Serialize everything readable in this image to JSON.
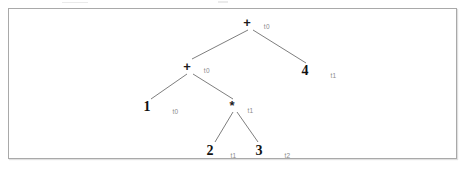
{
  "figure": {
    "kind": "expression-parse-tree",
    "expression": "1 + 2 * 3 + 4",
    "register_labels": [
      "t0",
      "t1",
      "t2"
    ]
  },
  "frame": {
    "border_color": "#a9a9a9",
    "background": "#ffffff"
  },
  "colors": {
    "node_text": "#111111",
    "register_text": "#8a8a8a",
    "edge": "#6f6f6f"
  },
  "nodes": [
    {
      "id": "root-plus",
      "symbol": "+",
      "register": "t0",
      "kind": "operator",
      "x": 250,
      "y": 22,
      "reg_dx": 13,
      "reg_dy": 2
    },
    {
      "id": "inner-plus",
      "symbol": "+",
      "register": "t0",
      "kind": "operator",
      "x": 190,
      "y": 66,
      "reg_dx": 13,
      "reg_dy": 2
    },
    {
      "id": "leaf-four",
      "symbol": "4",
      "register": "t1",
      "kind": "number",
      "x": 308,
      "y": 70,
      "reg_dx": 22,
      "reg_dy": 3
    },
    {
      "id": "leaf-one",
      "symbol": "1",
      "register": "t0",
      "kind": "number",
      "x": 150,
      "y": 106,
      "reg_dx": 22,
      "reg_dy": 3
    },
    {
      "id": "times",
      "symbol": "*",
      "register": "t1",
      "kind": "operator",
      "x": 235,
      "y": 105,
      "reg_dx": 13,
      "reg_dy": 3
    },
    {
      "id": "leaf-two",
      "symbol": "2",
      "register": "t1",
      "kind": "number",
      "x": 213,
      "y": 150,
      "reg_dx": 17,
      "reg_dy": 3
    },
    {
      "id": "leaf-three",
      "symbol": "3",
      "register": "t2",
      "kind": "number",
      "x": 262,
      "y": 150,
      "reg_dx": 22,
      "reg_dy": 3
    }
  ],
  "edges": [
    {
      "id": "root-to-inner-plus",
      "x1": 248,
      "y1": 30,
      "x2": 192,
      "y2": 59
    },
    {
      "id": "root-to-four",
      "x1": 253,
      "y1": 30,
      "x2": 306,
      "y2": 63
    },
    {
      "id": "inner-to-one",
      "x1": 187,
      "y1": 74,
      "x2": 151,
      "y2": 99
    },
    {
      "id": "inner-to-times",
      "x1": 193,
      "y1": 74,
      "x2": 233,
      "y2": 99
    },
    {
      "id": "times-to-two",
      "x1": 233,
      "y1": 112,
      "x2": 215,
      "y2": 142
    },
    {
      "id": "times-to-three",
      "x1": 237,
      "y1": 112,
      "x2": 258,
      "y2": 142
    }
  ]
}
